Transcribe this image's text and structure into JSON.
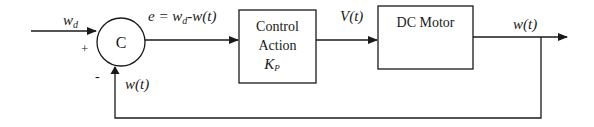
{
  "diagram": {
    "type": "feedback-control-block-diagram",
    "input": {
      "label_main": "w",
      "label_sub": "d"
    },
    "summing_junction": {
      "label": "C",
      "plus_sign": "+",
      "minus_sign": "-"
    },
    "error_signal": {
      "label_prefix": "e = w",
      "label_sub": "d",
      "label_suffix": "-w(t)"
    },
    "controller_block": {
      "line1": "Control",
      "line2": "Action",
      "gain_main": "K",
      "gain_sub": "P"
    },
    "control_signal": {
      "label": "V(t)"
    },
    "plant_block": {
      "label": "DC Motor"
    },
    "output": {
      "label": "w(t)"
    },
    "feedback": {
      "label": "w(t)"
    }
  }
}
